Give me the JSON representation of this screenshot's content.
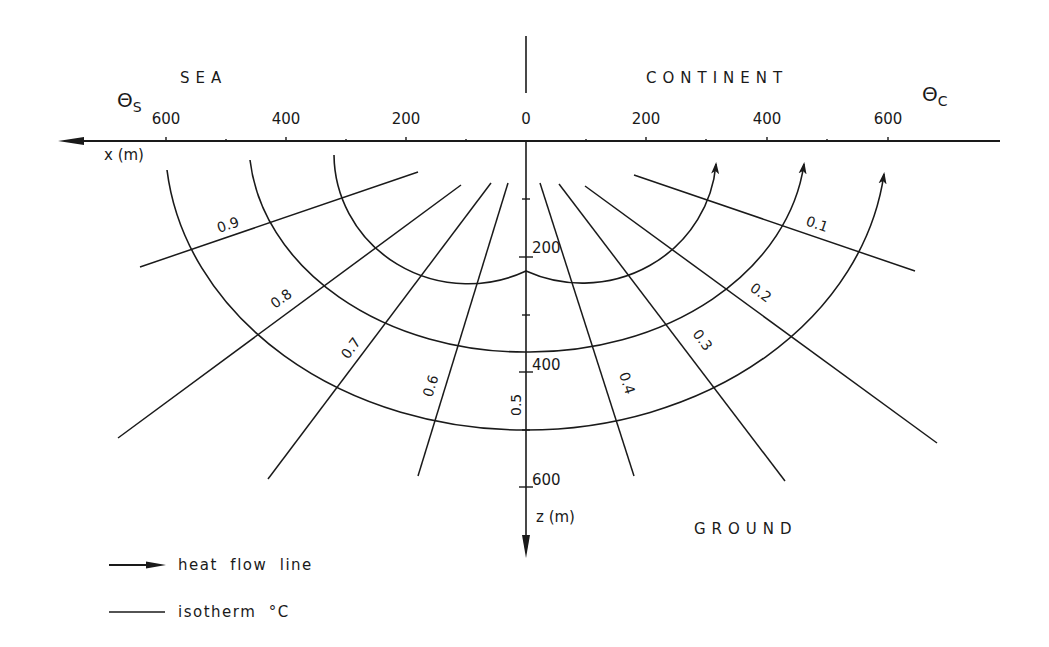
{
  "diagram": {
    "regions": {
      "sea": "SEA",
      "continent": "CONTINENT",
      "ground": "GROUND"
    },
    "theta_labels": {
      "sea": {
        "symbol": "Θ",
        "subscript": "S"
      },
      "continent": {
        "symbol": "Θ",
        "subscript": "C"
      }
    },
    "x_axis": {
      "label": "x (m)",
      "ticks_left": [
        "600",
        "400",
        "200"
      ],
      "origin": "0",
      "ticks_right": [
        "200",
        "400",
        "600"
      ]
    },
    "z_axis": {
      "label": "z (m)",
      "ticks": [
        "200",
        "400",
        "600"
      ]
    },
    "isotherms": [
      "0.9",
      "0.8",
      "0.7",
      "0.6",
      "0.5",
      "0.4",
      "0.3",
      "0.2",
      "0.1"
    ],
    "heat_flow_lines_count": 3
  },
  "legend": {
    "items": [
      {
        "symbol": "arrow-line",
        "label": "heat  flow  line"
      },
      {
        "symbol": "plain-line",
        "label": "isotherm  °C"
      }
    ]
  }
}
